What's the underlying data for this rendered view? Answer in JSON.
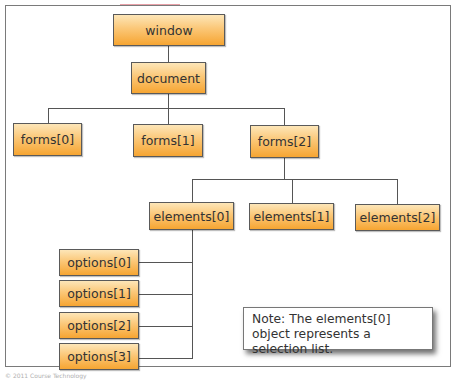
{
  "diagram": {
    "nodes": {
      "window": "window",
      "document": "document",
      "forms": [
        "forms[0]",
        "forms[1]",
        "forms[2]"
      ],
      "elements": [
        "elements[0]",
        "elements[1]",
        "elements[2]"
      ],
      "options": [
        "options[0]",
        "options[1]",
        "options[2]",
        "options[3]"
      ]
    },
    "edges": [
      [
        "window",
        "document"
      ],
      [
        "document",
        "forms[0]"
      ],
      [
        "document",
        "forms[1]"
      ],
      [
        "document",
        "forms[2]"
      ],
      [
        "forms[2]",
        "elements[0]"
      ],
      [
        "forms[2]",
        "elements[1]"
      ],
      [
        "forms[2]",
        "elements[2]"
      ],
      [
        "elements[0]",
        "options[0]"
      ],
      [
        "elements[0]",
        "options[1]"
      ],
      [
        "elements[0]",
        "options[2]"
      ],
      [
        "elements[0]",
        "options[3]"
      ]
    ],
    "note": "Note: The elements[0] object represents a selection list.",
    "colors": {
      "node_fill_top": "#fde6b8",
      "node_fill_bottom": "#f6a532",
      "node_border": "#5a5a5a",
      "line": "#555555"
    }
  },
  "footer": {
    "copyright": "© 2011 Course Technology"
  }
}
